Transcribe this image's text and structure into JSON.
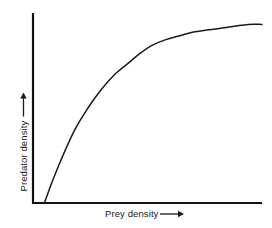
{
  "figure": {
    "background_color": "#ffffff",
    "line_color": "#1a1a1a",
    "axis_color": "#111111"
  },
  "axes": {
    "x": {
      "label": "Prey density",
      "arrow": "right-arrow-icon"
    },
    "y": {
      "label": "Predator density",
      "arrow": "up-arrow-icon"
    }
  },
  "chart_data": {
    "type": "line",
    "title": "",
    "xlabel": "Prey density",
    "ylabel": "Predator density",
    "xlim": [
      0,
      100
    ],
    "ylim": [
      0,
      100
    ],
    "grid": false,
    "legend": null,
    "axis_ticks": {
      "x": [],
      "y": []
    },
    "annotations": [],
    "series": [
      {
        "name": "Predator response curve",
        "description": "Saturating curve rising from a threshold on the x-axis to an asymptotic plateau",
        "x": [
          5,
          8,
          12,
          18,
          24,
          30,
          36,
          42,
          47,
          52,
          58,
          64,
          70,
          76,
          82,
          88,
          94,
          100
        ],
        "y": [
          0,
          10,
          22,
          38,
          50,
          60,
          68,
          74,
          79,
          83,
          86,
          88,
          90,
          91,
          92,
          93,
          94,
          94
        ]
      }
    ]
  }
}
